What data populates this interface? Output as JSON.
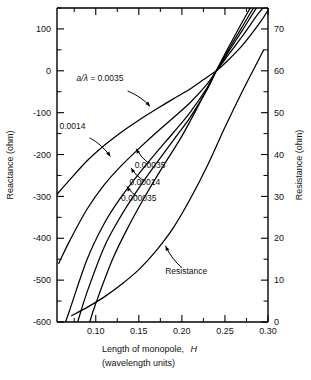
{
  "chart_data": {
    "type": "line",
    "title": "",
    "xlabel": "Length of monopole, H (wavelength units)",
    "xlabel_line1": "Length of monopole,",
    "xlabel_line1_italic": "H",
    "xlabel_line2": "(wavelength units)",
    "ylabel": "Reactance (ohm)",
    "ylabel_right": "Resistance (ohm)",
    "xlim": [
      0.055,
      0.3
    ],
    "ylim_left": [
      -600,
      150
    ],
    "ylim_right": [
      0,
      75
    ],
    "grid": false,
    "legend_position": "inline-annotations",
    "xticks": [
      "0.10",
      "0.15",
      "0.20",
      "0.25",
      "0.30"
    ],
    "xtick_values": [
      0.1,
      0.15,
      0.2,
      0.25,
      0.3
    ],
    "xtick_minor_values": [
      0.075,
      0.125,
      0.175,
      0.225,
      0.275
    ],
    "yticks_left": [
      "100",
      "0",
      "-100",
      "-200",
      "-300",
      "-400",
      "-500",
      "-600"
    ],
    "ytick_left_values": [
      100,
      0,
      -100,
      -200,
      -300,
      -400,
      -500,
      -600
    ],
    "ytick_left_minor_values": [
      150,
      50,
      -50,
      -150,
      -250,
      -350,
      -450,
      -550
    ],
    "yticks_right": [
      "70",
      "60",
      "50",
      "40",
      "30",
      "20",
      "10",
      "0"
    ],
    "ytick_right_values": [
      70,
      60,
      50,
      40,
      30,
      20,
      10,
      0
    ],
    "ytick_right_minor_values": [
      75,
      65,
      55,
      45,
      35,
      25,
      15,
      5
    ],
    "series": [
      {
        "name": "a/lambda = 0.0035",
        "label": "0.0035",
        "label_prefix": "a/λ = ",
        "axis": "left",
        "x": [
          0.055,
          0.07,
          0.09,
          0.11,
          0.13,
          0.15,
          0.17,
          0.19,
          0.21,
          0.23,
          0.24,
          0.25,
          0.27,
          0.29,
          0.3
        ],
        "y": [
          -295,
          -260,
          -215,
          -178,
          -146,
          -118,
          -92,
          -67,
          -43,
          -14,
          0,
          18,
          60,
          113,
          145
        ]
      },
      {
        "name": "a/lambda = 0.0014",
        "label": "0.0014",
        "axis": "left",
        "x": [
          0.057,
          0.07,
          0.09,
          0.11,
          0.13,
          0.15,
          0.17,
          0.19,
          0.21,
          0.23,
          0.24,
          0.25,
          0.27,
          0.29,
          0.3
        ],
        "y": [
          -460,
          -405,
          -330,
          -272,
          -226,
          -186,
          -148,
          -112,
          -75,
          -30,
          0,
          27,
          82,
          140,
          160
        ]
      },
      {
        "name": "a/lambda = 0.00035",
        "label": "0.00035",
        "axis": "left",
        "x": [
          0.065,
          0.07,
          0.09,
          0.11,
          0.13,
          0.15,
          0.17,
          0.19,
          0.21,
          0.23,
          0.24,
          0.25,
          0.27,
          0.29,
          0.3
        ],
        "y": [
          -600,
          -570,
          -450,
          -364,
          -300,
          -246,
          -196,
          -148,
          -98,
          -38,
          0,
          32,
          96,
          160,
          178
        ]
      },
      {
        "name": "a/lambda = 0.00014",
        "label": "0.00014",
        "axis": "left",
        "x": [
          0.079,
          0.09,
          0.11,
          0.13,
          0.15,
          0.17,
          0.19,
          0.21,
          0.23,
          0.24,
          0.25,
          0.27,
          0.29,
          0.3
        ],
        "y": [
          -600,
          -528,
          -420,
          -344,
          -280,
          -222,
          -166,
          -110,
          -42,
          0,
          36,
          105,
          172,
          190
        ]
      },
      {
        "name": "a/lambda = 0.000035",
        "label": "0.000035",
        "axis": "left",
        "x": [
          0.093,
          0.1,
          0.12,
          0.14,
          0.16,
          0.18,
          0.2,
          0.22,
          0.23,
          0.24,
          0.25,
          0.27,
          0.29,
          0.3
        ],
        "y": [
          -600,
          -556,
          -448,
          -364,
          -290,
          -222,
          -156,
          -80,
          -40,
          0,
          40,
          116,
          186,
          205
        ]
      },
      {
        "name": "Resistance",
        "label": "Resistance",
        "axis": "right",
        "x": [
          0.072,
          0.09,
          0.11,
          0.13,
          0.15,
          0.17,
          0.19,
          0.21,
          0.23,
          0.25,
          0.27,
          0.29,
          0.295
        ],
        "y": [
          1.5,
          3.5,
          6.0,
          9.0,
          12.5,
          17.0,
          22.5,
          29.5,
          37.5,
          46.5,
          55.0,
          63.0,
          65.0
        ]
      }
    ],
    "annotations": [
      {
        "id": "label-a-lambda",
        "text_prefix": "a/λ = ",
        "text": "0.0035",
        "text_x": 0.105,
        "text_y_left": -25,
        "leader_from": [
          0.137,
          -48
        ],
        "leader_to": [
          0.163,
          -85
        ]
      },
      {
        "id": "label-0-0014",
        "text": "0.0014",
        "text_x": 0.073,
        "text_y_left": -138,
        "leader_from": [
          0.093,
          -160
        ],
        "leader_to": [
          0.117,
          -205
        ]
      },
      {
        "id": "label-0-00035",
        "text": "0.00035",
        "text_x": 0.163,
        "text_y_left": -233,
        "leader_from": [
          0.162,
          -222
        ],
        "leader_to": [
          0.147,
          -186
        ]
      },
      {
        "id": "label-0-00014",
        "text": "0.00014",
        "text_x": 0.157,
        "text_y_left": -272,
        "leader_from": [
          0.155,
          -262
        ],
        "leader_to": [
          0.141,
          -232
        ]
      },
      {
        "id": "label-0-000035",
        "text": "0.000035",
        "text_x": 0.15,
        "text_y_left": -310,
        "leader_from": [
          0.148,
          -300
        ],
        "leader_to": [
          0.136,
          -276
        ]
      },
      {
        "id": "label-resistance",
        "text": "Resistance",
        "text_x": 0.205,
        "text_y_right": 11.5,
        "leader_from": [
          0.2,
          13.0
        ],
        "leader_to": [
          0.181,
          18.2
        ]
      }
    ]
  },
  "colors": {
    "background": "#ffffff",
    "ink": "#000000",
    "text": "#111111"
  }
}
